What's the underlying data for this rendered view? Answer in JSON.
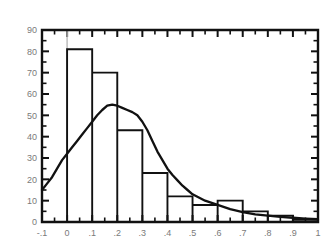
{
  "chart_data": {
    "type": "bar",
    "title": "",
    "subtitle": "",
    "xlabel": "",
    "ylabel": "",
    "grid": false,
    "legend": null,
    "xlim": [
      -0.1,
      1.0
    ],
    "ylim": [
      0,
      90
    ],
    "bin_width": 0.1,
    "x_tick_labels": [
      "-.1",
      "0",
      ".1",
      ".2",
      ".3",
      ".4",
      ".5",
      ".6",
      ".7",
      ".8",
      ".9",
      "1"
    ],
    "x_tick_values": [
      -0.1,
      0,
      0.1,
      0.2,
      0.3,
      0.4,
      0.5,
      0.6,
      0.7,
      0.8,
      0.9,
      1.0
    ],
    "y_tick_labels": [
      "0",
      "10",
      "20",
      "30",
      "40",
      "50",
      "60",
      "70",
      "80",
      "90"
    ],
    "y_tick_values": [
      0,
      10,
      20,
      30,
      40,
      50,
      60,
      70,
      80,
      90
    ],
    "minor_ticks_per_interval": 2,
    "categories": [
      "-.1 to 0",
      "0 to .1",
      ".1 to .2",
      ".2 to .3",
      ".3 to .4",
      ".4 to .5",
      ".5 to .6",
      ".6 to .7",
      ".7 to .8",
      ".8 to .9",
      ".9 to 1"
    ],
    "bin_edges": [
      -0.1,
      0.0,
      0.1,
      0.2,
      0.3,
      0.4,
      0.5,
      0.6,
      0.7,
      0.8,
      0.9,
      1.0
    ],
    "values": [
      0,
      81,
      70,
      43,
      23,
      12,
      8,
      10,
      5,
      3,
      1
    ],
    "series": [
      {
        "name": "histogram",
        "type": "bar",
        "values": [
          0,
          81,
          70,
          43,
          23,
          12,
          8,
          10,
          5,
          3,
          1
        ]
      },
      {
        "name": "density-curve",
        "type": "line",
        "x": [
          -0.1,
          -0.08,
          -0.06,
          -0.04,
          -0.02,
          0.0,
          0.02,
          0.04,
          0.06,
          0.08,
          0.1,
          0.12,
          0.14,
          0.16,
          0.18,
          0.2,
          0.22,
          0.24,
          0.26,
          0.28,
          0.3,
          0.32,
          0.34,
          0.36,
          0.38,
          0.4,
          0.42,
          0.44,
          0.46,
          0.48,
          0.5,
          0.55,
          0.6,
          0.65,
          0.7,
          0.75,
          0.8,
          0.85,
          0.9,
          0.95,
          1.0
        ],
        "y": [
          15,
          18,
          21,
          25,
          29,
          32,
          35,
          38,
          41,
          44,
          47,
          50,
          52.5,
          54.5,
          55,
          54.5,
          53.5,
          52.5,
          51.5,
          50,
          47,
          43,
          38,
          33,
          29,
          25,
          22,
          19.5,
          17,
          15,
          13,
          10,
          8,
          6,
          4.6,
          3.6,
          3,
          2.4,
          2,
          1.6,
          1.3
        ]
      }
    ],
    "colors": {
      "axis": "#111111",
      "bar_stroke": "#111111",
      "curve": "#111111",
      "tick_label": "#7a7a7a",
      "background": "#ffffff",
      "zero_guide": "#b9b9b9"
    },
    "annotations": []
  }
}
